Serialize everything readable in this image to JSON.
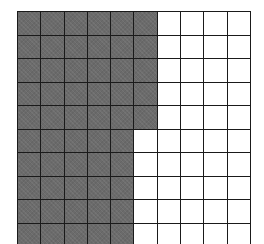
{
  "figure": {
    "type": "hundred-grid",
    "rows": 10,
    "columns": 10,
    "shaded_color": "#6b6b6b",
    "unshaded_color": "#ffffff",
    "line_color": "#1a1a1a",
    "shaded_columns_per_row": [
      6,
      6,
      6,
      6,
      6,
      5,
      5,
      5,
      5,
      5
    ],
    "shaded_count": 55,
    "total_count": 100
  }
}
